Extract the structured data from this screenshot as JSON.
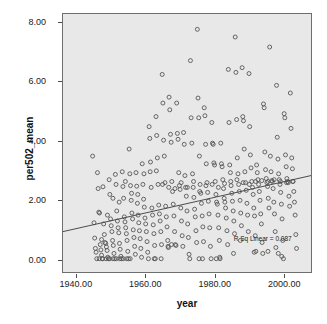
{
  "chart_data": {
    "type": "scatter",
    "title": "",
    "xlabel": "year",
    "ylabel": "per502_mean",
    "xlim": [
      1936,
      2008
    ],
    "ylim": [
      -0.45,
      8.3
    ],
    "grid": false,
    "legend": null,
    "annotations": [
      {
        "name": "r-squared-linear",
        "text": "R Sq Linear = 0.087",
        "x": 1993.5,
        "y": 0.78
      }
    ],
    "xticks": [
      1940,
      1960,
      1980,
      2000
    ],
    "xtick_labels": [
      "1940.00",
      "1960.00",
      "1980.00",
      "2000.00"
    ],
    "yticks": [
      0,
      2,
      4,
      6,
      8
    ],
    "ytick_labels": [
      "0.00",
      "2.00",
      "4.00",
      "6.00",
      "8.00"
    ],
    "fit_line": {
      "type": "linear",
      "r_squared": 0.087,
      "x_start": 1936,
      "y_start": 0.92,
      "x_end": 2008,
      "y_end": 2.82
    },
    "marker": {
      "shape": "open-circle",
      "size": 4,
      "edge_color": "#555555",
      "fill_color": "none"
    },
    "plot_background": "#e8e8e8",
    "frame_color": "#6e6e6e",
    "points": [
      [
        1944.6,
        3.48
      ],
      [
        1945.0,
        1.22
      ],
      [
        1945.2,
        0.7
      ],
      [
        1945.4,
        0.35
      ],
      [
        1945.6,
        0.22
      ],
      [
        1945.8,
        0.0
      ],
      [
        1946.0,
        2.92
      ],
      [
        1946.2,
        2.38
      ],
      [
        1946.4,
        1.58
      ],
      [
        1946.6,
        1.55
      ],
      [
        1946.8,
        0.48
      ],
      [
        1947.0,
        0.3
      ],
      [
        1947.2,
        0.12
      ],
      [
        1947.4,
        0.0
      ],
      [
        1947.6,
        2.44
      ],
      [
        1947.8,
        1.18
      ],
      [
        1948.0,
        0.82
      ],
      [
        1948.2,
        0.55
      ],
      [
        1948.4,
        0.52
      ],
      [
        1948.6,
        0.4
      ],
      [
        1948.8,
        0.28
      ],
      [
        1949.0,
        0.05
      ],
      [
        1949.2,
        0.0
      ],
      [
        1949.4,
        2.68
      ],
      [
        1949.6,
        2.18
      ],
      [
        1949.8,
        1.35
      ],
      [
        1950.0,
        1.12
      ],
      [
        1950.2,
        0.92
      ],
      [
        1950.4,
        0.62
      ],
      [
        1950.6,
        0.45
      ],
      [
        1950.8,
        0.18
      ],
      [
        1951.0,
        0.0
      ],
      [
        1951.2,
        2.86
      ],
      [
        1951.4,
        2.52
      ],
      [
        1951.6,
        1.62
      ],
      [
        1951.8,
        1.28
      ],
      [
        1952.0,
        1.05
      ],
      [
        1952.2,
        0.88
      ],
      [
        1952.4,
        0.52
      ],
      [
        1952.6,
        0.32
      ],
      [
        1952.8,
        0.08
      ],
      [
        1953.0,
        0.0
      ],
      [
        1953.2,
        2.95
      ],
      [
        1953.4,
        2.45
      ],
      [
        1953.6,
        2.05
      ],
      [
        1953.8,
        1.42
      ],
      [
        1954.0,
        1.25
      ],
      [
        1954.2,
        1.05
      ],
      [
        1954.4,
        0.85
      ],
      [
        1954.6,
        0.62
      ],
      [
        1954.8,
        0.25
      ],
      [
        1955.0,
        0.0
      ],
      [
        1955.2,
        3.72
      ],
      [
        1955.4,
        2.88
      ],
      [
        1955.6,
        2.48
      ],
      [
        1955.8,
        1.98
      ],
      [
        1956.0,
        1.55
      ],
      [
        1956.2,
        1.35
      ],
      [
        1956.4,
        0.98
      ],
      [
        1956.6,
        0.72
      ],
      [
        1956.8,
        0.42
      ],
      [
        1957.0,
        0.15
      ],
      [
        1957.2,
        2.92
      ],
      [
        1957.4,
        2.46
      ],
      [
        1957.6,
        1.88
      ],
      [
        1957.8,
        1.48
      ],
      [
        1958.0,
        1.22
      ],
      [
        1958.2,
        0.95
      ],
      [
        1958.4,
        0.68
      ],
      [
        1958.6,
        0.35
      ],
      [
        1958.8,
        0.05
      ],
      [
        1959.0,
        3.22
      ],
      [
        1959.2,
        2.52
      ],
      [
        1959.4,
        2.02
      ],
      [
        1959.6,
        1.75
      ],
      [
        1959.8,
        1.38
      ],
      [
        1960.0,
        1.18
      ],
      [
        1960.2,
        0.92
      ],
      [
        1960.4,
        0.58
      ],
      [
        1960.6,
        0.22
      ],
      [
        1960.8,
        0.0
      ],
      [
        1961.0,
        4.48
      ],
      [
        1961.2,
        4.08
      ],
      [
        1961.4,
        3.28
      ],
      [
        1961.6,
        2.42
      ],
      [
        1961.8,
        1.72
      ],
      [
        1962.0,
        1.48
      ],
      [
        1962.2,
        1.15
      ],
      [
        1962.4,
        0.85
      ],
      [
        1962.6,
        0.45
      ],
      [
        1962.8,
        0.0
      ],
      [
        1963.0,
        4.82
      ],
      [
        1963.2,
        4.18
      ],
      [
        1963.4,
        3.42
      ],
      [
        1963.6,
        2.52
      ],
      [
        1963.8,
        1.82
      ],
      [
        1964.0,
        1.52
      ],
      [
        1964.2,
        1.28
      ],
      [
        1964.4,
        0.92
      ],
      [
        1964.6,
        0.48
      ],
      [
        1964.8,
        6.25
      ],
      [
        1965.0,
        5.28
      ],
      [
        1965.2,
        4.02
      ],
      [
        1965.4,
        3.48
      ],
      [
        1965.6,
        2.58
      ],
      [
        1965.8,
        1.78
      ],
      [
        1966.0,
        1.42
      ],
      [
        1966.2,
        1.08
      ],
      [
        1966.4,
        0.62
      ],
      [
        1966.6,
        0.38
      ],
      [
        1966.8,
        5.48
      ],
      [
        1967.0,
        5.05
      ],
      [
        1967.2,
        4.22
      ],
      [
        1967.4,
        3.95
      ],
      [
        1967.6,
        2.62
      ],
      [
        1967.8,
        2.28
      ],
      [
        1968.0,
        1.85
      ],
      [
        1968.2,
        1.45
      ],
      [
        1968.4,
        0.92
      ],
      [
        1968.6,
        0.48
      ],
      [
        1968.8,
        0.45
      ],
      [
        1969.0,
        5.28
      ],
      [
        1969.2,
        4.25
      ],
      [
        1969.4,
        4.05
      ],
      [
        1969.6,
        2.92
      ],
      [
        1969.8,
        2.48
      ],
      [
        1970.0,
        2.35
      ],
      [
        1970.2,
        1.72
      ],
      [
        1970.4,
        1.28
      ],
      [
        1970.6,
        0.78
      ],
      [
        1970.8,
        0.42
      ],
      [
        1971.0,
        4.28
      ],
      [
        1971.2,
        3.88
      ],
      [
        1971.4,
        2.82
      ],
      [
        1971.6,
        2.42
      ],
      [
        1971.8,
        2.12
      ],
      [
        1972.0,
        1.62
      ],
      [
        1972.2,
        1.18
      ],
      [
        1972.4,
        0.72
      ],
      [
        1972.6,
        0.15
      ],
      [
        1972.8,
        0.0
      ],
      [
        1973.0,
        6.72
      ],
      [
        1973.2,
        4.78
      ],
      [
        1973.4,
        3.92
      ],
      [
        1973.6,
        2.88
      ],
      [
        1973.8,
        2.42
      ],
      [
        1974.0,
        2.08
      ],
      [
        1974.2,
        1.68
      ],
      [
        1974.4,
        1.42
      ],
      [
        1974.6,
        0.95
      ],
      [
        1974.8,
        0.55
      ],
      [
        1975.0,
        7.78
      ],
      [
        1975.2,
        5.45
      ],
      [
        1975.4,
        4.78
      ],
      [
        1975.6,
        3.48
      ],
      [
        1975.8,
        2.52
      ],
      [
        1976.0,
        2.22
      ],
      [
        1976.2,
        1.88
      ],
      [
        1976.4,
        1.45
      ],
      [
        1976.6,
        1.08
      ],
      [
        1976.8,
        0.58
      ],
      [
        1977.0,
        5.12
      ],
      [
        1977.2,
        4.85
      ],
      [
        1977.4,
        3.88
      ],
      [
        1977.6,
        3.22
      ],
      [
        1977.8,
        2.58
      ],
      [
        1978.0,
        2.25
      ],
      [
        1978.2,
        1.95
      ],
      [
        1978.4,
        1.52
      ],
      [
        1978.6,
        1.05
      ],
      [
        1978.8,
        0.42
      ],
      [
        1979.0,
        0.0
      ],
      [
        1979.2,
        4.62
      ],
      [
        1979.4,
        3.92
      ],
      [
        1979.6,
        3.88
      ],
      [
        1979.8,
        3.25
      ],
      [
        1980.0,
        3.18
      ],
      [
        1980.2,
        2.62
      ],
      [
        1980.4,
        2.18
      ],
      [
        1980.6,
        1.92
      ],
      [
        1980.8,
        1.85
      ],
      [
        1981.0,
        1.48
      ],
      [
        1981.2,
        1.05
      ],
      [
        1981.4,
        0.62
      ],
      [
        1981.6,
        0.0
      ],
      [
        1981.8,
        3.92
      ],
      [
        1982.0,
        3.22
      ],
      [
        1982.2,
        3.12
      ],
      [
        1982.4,
        2.68
      ],
      [
        1982.6,
        2.38
      ],
      [
        1982.8,
        2.05
      ],
      [
        1983.0,
        1.92
      ],
      [
        1983.2,
        1.72
      ],
      [
        1983.4,
        1.38
      ],
      [
        1983.6,
        0.95
      ],
      [
        1983.8,
        0.48
      ],
      [
        1984.0,
        6.42
      ],
      [
        1984.2,
        4.62
      ],
      [
        1984.4,
        3.18
      ],
      [
        1984.6,
        2.92
      ],
      [
        1984.8,
        2.48
      ],
      [
        1985.0,
        2.22
      ],
      [
        1985.2,
        1.95
      ],
      [
        1985.4,
        1.62
      ],
      [
        1985.6,
        1.28
      ],
      [
        1985.8,
        0.85
      ],
      [
        1986.0,
        7.52
      ],
      [
        1986.2,
        6.32
      ],
      [
        1986.4,
        4.72
      ],
      [
        1986.6,
        3.42
      ],
      [
        1986.8,
        2.88
      ],
      [
        1987.0,
        2.52
      ],
      [
        1987.2,
        2.28
      ],
      [
        1987.4,
        1.98
      ],
      [
        1987.6,
        1.55
      ],
      [
        1987.8,
        1.12
      ],
      [
        1988.0,
        6.48
      ],
      [
        1988.2,
        4.82
      ],
      [
        1988.4,
        4.68
      ],
      [
        1988.6,
        3.72
      ],
      [
        1988.8,
        2.95
      ],
      [
        1989.0,
        2.58
      ],
      [
        1989.2,
        2.32
      ],
      [
        1989.4,
        1.88
      ],
      [
        1989.6,
        1.48
      ],
      [
        1989.8,
        0.92
      ],
      [
        1990.0,
        6.28
      ],
      [
        1990.2,
        4.48
      ],
      [
        1990.4,
        3.52
      ],
      [
        1990.6,
        3.08
      ],
      [
        1990.8,
        2.62
      ],
      [
        1991.0,
        2.42
      ],
      [
        1991.2,
        2.18
      ],
      [
        1991.4,
        1.72
      ],
      [
        1991.6,
        1.45
      ],
      [
        1991.8,
        0.78
      ],
      [
        1992.0,
        0.25
      ],
      [
        1992.2,
        3.18
      ],
      [
        1992.4,
        2.92
      ],
      [
        1992.6,
        2.68
      ],
      [
        1992.8,
        2.52
      ],
      [
        1993.0,
        2.28
      ],
      [
        1993.2,
        1.98
      ],
      [
        1993.4,
        1.52
      ],
      [
        1993.6,
        1.18
      ],
      [
        1993.8,
        0.55
      ],
      [
        1994.0,
        0.18
      ],
      [
        1994.2,
        5.25
      ],
      [
        1994.4,
        5.12
      ],
      [
        1994.6,
        3.62
      ],
      [
        1994.8,
        3.02
      ],
      [
        1995.0,
        2.72
      ],
      [
        1995.2,
        2.58
      ],
      [
        1995.4,
        2.45
      ],
      [
        1995.6,
        2.05
      ],
      [
        1995.8,
        1.72
      ],
      [
        1996.0,
        7.18
      ],
      [
        1996.2,
        3.48
      ],
      [
        1996.4,
        2.95
      ],
      [
        1996.6,
        2.65
      ],
      [
        1996.8,
        2.62
      ],
      [
        1997.0,
        2.38
      ],
      [
        1997.2,
        1.92
      ],
      [
        1997.4,
        1.52
      ],
      [
        1997.6,
        0.92
      ],
      [
        1997.8,
        0.38
      ],
      [
        1998.0,
        5.88
      ],
      [
        1998.2,
        4.12
      ],
      [
        1998.4,
        3.38
      ],
      [
        1998.6,
        2.88
      ],
      [
        1998.8,
        2.68
      ],
      [
        1999.0,
        2.52
      ],
      [
        1999.2,
        2.25
      ],
      [
        1999.4,
        1.85
      ],
      [
        1999.6,
        1.35
      ],
      [
        1999.8,
        0.62
      ],
      [
        2000.0,
        0.0
      ],
      [
        2000.2,
        4.92
      ],
      [
        2000.4,
        4.78
      ],
      [
        2000.6,
        3.52
      ],
      [
        2000.8,
        3.12
      ],
      [
        2001.0,
        2.72
      ],
      [
        2001.2,
        2.62
      ],
      [
        2001.4,
        2.58
      ],
      [
        2001.6,
        2.12
      ],
      [
        2001.8,
        1.78
      ],
      [
        2002.0,
        5.62
      ],
      [
        2002.2,
        4.42
      ],
      [
        2002.4,
        3.42
      ],
      [
        2002.6,
        3.05
      ],
      [
        2002.8,
        2.62
      ],
      [
        2003.0,
        2.28
      ],
      [
        2003.2,
        1.92
      ],
      [
        2003.4,
        1.48
      ],
      [
        2003.6,
        0.82
      ],
      [
        2003.8,
        0.35
      ],
      [
        1947.2,
        0.65
      ],
      [
        1948.9,
        1.48
      ],
      [
        1950.5,
        2.05
      ],
      [
        1952.3,
        1.92
      ],
      [
        1954.1,
        2.62
      ],
      [
        1955.9,
        2.22
      ],
      [
        1957.7,
        2.18
      ],
      [
        1959.5,
        2.88
      ],
      [
        1961.3,
        2.95
      ],
      [
        1963.1,
        2.98
      ],
      [
        1964.9,
        2.52
      ],
      [
        1966.7,
        2.42
      ],
      [
        1968.5,
        2.38
      ],
      [
        1970.3,
        2.58
      ],
      [
        1972.1,
        2.42
      ],
      [
        1973.9,
        2.62
      ],
      [
        1975.7,
        2.28
      ],
      [
        1977.5,
        2.48
      ],
      [
        1979.3,
        2.52
      ],
      [
        1981.1,
        2.42
      ],
      [
        1982.9,
        2.55
      ],
      [
        1984.7,
        2.62
      ],
      [
        1986.5,
        2.68
      ],
      [
        1988.3,
        2.58
      ],
      [
        1990.1,
        2.52
      ],
      [
        1991.9,
        2.62
      ],
      [
        1993.7,
        2.65
      ],
      [
        1995.5,
        2.62
      ],
      [
        1997.3,
        2.68
      ],
      [
        1999.1,
        2.62
      ],
      [
        2000.9,
        2.58
      ],
      [
        2002.7,
        2.62
      ],
      [
        1946.5,
        0.0
      ],
      [
        1947.5,
        0.0
      ],
      [
        1948.5,
        0.0
      ],
      [
        1949.5,
        0.0
      ],
      [
        1950.5,
        0.0
      ],
      [
        1951.5,
        0.0
      ],
      [
        1952.5,
        0.0
      ],
      [
        1953.5,
        0.0
      ],
      [
        1954.5,
        0.0
      ],
      [
        1955.5,
        0.0
      ],
      [
        1962.5,
        0.0
      ],
      [
        1964.5,
        0.0
      ],
      [
        1966.5,
        0.42
      ],
      [
        1967.5,
        0.48
      ],
      [
        1975.5,
        0.0
      ],
      [
        1976.5,
        0.0
      ],
      [
        1980.5,
        0.0
      ],
      [
        1981.5,
        0.05
      ],
      [
        1985.5,
        0.18
      ],
      [
        1987.5,
        0.62
      ],
      [
        1991.5,
        0.22
      ],
      [
        1995.5,
        0.25
      ],
      [
        1999.5,
        0.08
      ],
      [
        1998.5,
        0.18
      ]
    ]
  }
}
